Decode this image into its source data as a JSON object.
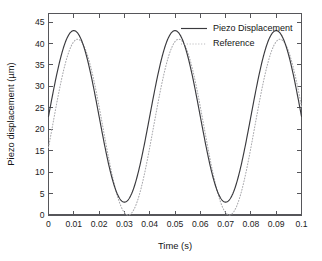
{
  "chart_data": {
    "type": "line",
    "title": "",
    "xlabel": "Time (s)",
    "ylabel": "Piezo displacement (µm)",
    "xlim": [
      0,
      0.1
    ],
    "ylim": [
      0,
      47
    ],
    "xticks": [
      0,
      0.01,
      0.02,
      0.03,
      0.04,
      0.05,
      0.06,
      0.07,
      0.08,
      0.09,
      0.1
    ],
    "xticklabels": [
      "0",
      "0.01",
      "0.02",
      "0.03",
      "0.04",
      "0.05",
      "0.06",
      "0.07",
      "0.08",
      "0.09",
      "0.1"
    ],
    "yticks": [
      0,
      5,
      10,
      15,
      20,
      25,
      30,
      35,
      40,
      45
    ],
    "yticklabels": [
      "0",
      "5",
      "10",
      "15",
      "20",
      "25",
      "30",
      "35",
      "40",
      "45"
    ],
    "grid": false,
    "legend_position": "top-center-right",
    "series": [
      {
        "name": "Piezo Displacement",
        "style": "solid",
        "color": "#3a3a3e",
        "waveform": "sine",
        "amplitude": 20.0,
        "offset": 23.0,
        "period": 0.04,
        "phase_peak_times": [
          0.01,
          0.05,
          0.09
        ],
        "peak_value": 43.0,
        "trough_value": 3.0,
        "start_value": 23.0,
        "end_value": 24.5,
        "x": [
          0,
          0.0025,
          0.005,
          0.0075,
          0.01,
          0.0125,
          0.015,
          0.0175,
          0.02,
          0.0225,
          0.025,
          0.0275,
          0.03,
          0.0325,
          0.035,
          0.0375,
          0.04,
          0.0425,
          0.045,
          0.0475,
          0.05,
          0.0525,
          0.055,
          0.0575,
          0.06,
          0.0625,
          0.065,
          0.0675,
          0.07,
          0.0725,
          0.075,
          0.0775,
          0.08,
          0.0825,
          0.085,
          0.0875,
          0.09,
          0.0925,
          0.095,
          0.0975,
          0.1
        ],
        "y": [
          23.0,
          33.0,
          40.1,
          43.0,
          43.0,
          40.1,
          33.0,
          25.9,
          23.0,
          25.9,
          33.0,
          40.1,
          43.0,
          40.1,
          33.0,
          25.9,
          23.0,
          25.9,
          33.0,
          40.1,
          43.0,
          40.1,
          33.0,
          25.9,
          23.0,
          25.9,
          33.0,
          40.1,
          43.0,
          40.1,
          33.0,
          25.9,
          23.0,
          25.9,
          33.0,
          40.1,
          43.0,
          40.1,
          33.0,
          25.9,
          23.0
        ]
      },
      {
        "name": "Reference",
        "style": "dotted",
        "color": "#a8a8ac",
        "waveform": "sine",
        "amplitude": 20.5,
        "offset": 20.5,
        "period": 0.04,
        "phase_lag": 0.0015,
        "peak_value": 41.0,
        "trough_value": 0.0,
        "start_value": 22.0,
        "end_value": 22.0
      }
    ]
  },
  "legend": {
    "items": [
      {
        "label": "Piezo Displacement",
        "style": "solid"
      },
      {
        "label": "Reference",
        "style": "dotted"
      }
    ]
  },
  "axes": {
    "x_title": "Time (s)",
    "y_title": "Piezo displacement (µm)"
  }
}
